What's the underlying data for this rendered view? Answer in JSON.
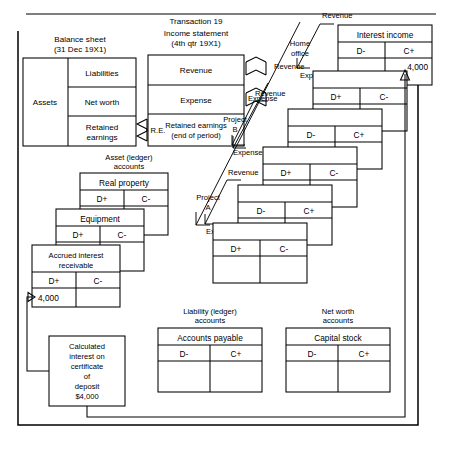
{
  "diagram": {
    "title": "Transaction 19",
    "top_rule": true,
    "sections": {
      "balance_sheet": {
        "heading_line1": "Balance sheet",
        "heading_line2": "(31 Dec 19X1)",
        "assets": "Assets",
        "liabilities": "Liabilities",
        "net_worth": "Net worth",
        "retained_earnings_line1": "Retained",
        "retained_earnings_line2": "earnings"
      },
      "income_statement": {
        "heading_line1": "Income statement",
        "heading_line2": "(4th qtr 19X1)",
        "revenue": "Revenue",
        "expense": "Expense",
        "retained_line1": "Retained earnings",
        "retained_line2": "(end of period)"
      },
      "re_link_label": "R.E.",
      "asset_accounts": {
        "heading_line1": "Asset (ledger)",
        "heading_line2": "accounts",
        "cards": [
          {
            "title": "Real property",
            "debit": "D+",
            "credit": "C-",
            "debit_value": "",
            "credit_value": ""
          },
          {
            "title": "Equipment",
            "debit": "D+",
            "credit": "C-",
            "debit_value": "",
            "credit_value": ""
          },
          {
            "title_line1": "Accrued interest",
            "title_line2": "receivable",
            "debit": "D+",
            "credit": "C-",
            "debit_value": "4,000",
            "credit_value": ""
          }
        ]
      },
      "liability_accounts": {
        "heading_line1": "Liability (ledger)",
        "heading_line2": "accounts",
        "title": "Accounts payable",
        "debit": "D-",
        "credit": "C+"
      },
      "net_worth_accounts": {
        "heading_line1": "Net worth",
        "heading_line2": "accounts",
        "title": "Capital stock",
        "debit": "D-",
        "credit": "C+"
      },
      "interest_income": {
        "title": "Interest income",
        "debit": "D-",
        "credit": "C+",
        "credit_value": "4,000"
      },
      "revenue_expense_stack": [
        {
          "debit": "D+",
          "credit": "C-"
        },
        {
          "debit": "D-",
          "credit": "C+"
        },
        {
          "debit": "D+",
          "credit": "C-"
        },
        {
          "debit": "D-",
          "credit": "C+"
        },
        {
          "debit": "D+",
          "credit": "C-"
        }
      ],
      "org_labels": [
        {
          "name": "home-office",
          "line1": "Home",
          "line2": "office",
          "revenue": "Revenue",
          "expense": "Expense"
        },
        {
          "name": "project-b",
          "line1": "Project",
          "line2": "B",
          "revenue": "Revenue",
          "expense": "Expense"
        },
        {
          "name": "project-a",
          "line1": "Project",
          "line2": "A",
          "revenue": "Revenue",
          "expense": "Expense"
        }
      ],
      "source_document": {
        "line1": "Calculated",
        "line2": "interest on",
        "line3": "certificate",
        "line4": "of",
        "line5": "deposit",
        "line6": "$4,000"
      }
    },
    "colors": {
      "ink": "#000000",
      "paper": "#ffffff"
    }
  }
}
